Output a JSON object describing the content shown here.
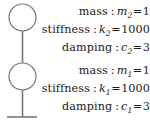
{
  "diagram": {
    "stroke_color": "#777777",
    "text_color": "#1a1a1a",
    "background": "#ffffff",
    "nodes": [
      {
        "name": "mass-2-circle",
        "cx": 22.5,
        "cy": 17.5,
        "r": 13.5
      },
      {
        "name": "mass-1-circle",
        "cx": 22.5,
        "cy": 76.5,
        "r": 13.5
      }
    ],
    "ground": {
      "y": 117,
      "x1": 7,
      "x2": 37
    }
  },
  "blocks": [
    {
      "id": "upper",
      "index": "2",
      "rows": [
        {
          "label": "mass",
          "separator": ":",
          "symbol": "m",
          "subscript": "2",
          "equals": "=",
          "value": "1"
        },
        {
          "label": "stiffness",
          "separator": ":",
          "symbol": "k",
          "subscript": "2",
          "equals": "=",
          "value": "1000"
        },
        {
          "label": "damping",
          "separator": ":",
          "symbol": "c",
          "subscript": "2",
          "equals": "=",
          "value": "3"
        }
      ]
    },
    {
      "id": "lower",
      "index": "1",
      "rows": [
        {
          "label": "mass",
          "separator": ":",
          "symbol": "m",
          "subscript": "1",
          "equals": "=",
          "value": "1"
        },
        {
          "label": "stiffness",
          "separator": ":",
          "symbol": "k",
          "subscript": "1",
          "equals": "=",
          "value": "1000"
        },
        {
          "label": "damping",
          "separator": ":",
          "symbol": "c",
          "subscript": "1",
          "equals": "=",
          "value": "3"
        }
      ]
    }
  ]
}
